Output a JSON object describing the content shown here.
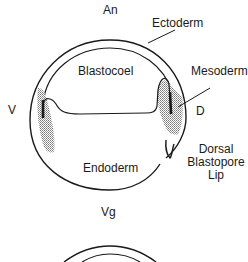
{
  "figure": {
    "type": "embryo cross-section diagram",
    "labels": {
      "animal_pole": "An",
      "vegetal_pole": "Vg",
      "ventral": "V",
      "dorsal": "D",
      "ectoderm": "Ectoderm",
      "blastocoel": "Blastocoel",
      "mesoderm": "Mesoderm",
      "endoderm": "Endoderm",
      "dorsal_blastopore_lip_line1": "Dorsal",
      "dorsal_blastopore_lip_line2": "Blastopore",
      "dorsal_blastopore_lip_line3": "Lip"
    },
    "colors": {
      "line": "#1a1a1a",
      "stipple": "#8a8a8a",
      "background": "#ffffff"
    }
  }
}
